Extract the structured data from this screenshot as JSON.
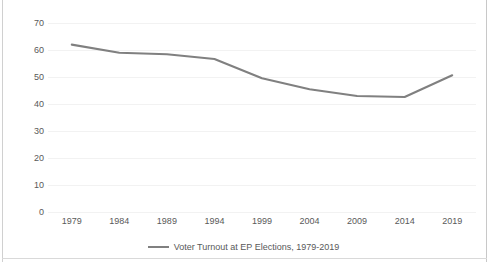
{
  "chart_data": {
    "type": "line",
    "title": "",
    "xlabel": "",
    "ylabel": "",
    "categories": [
      "1979",
      "1984",
      "1989",
      "1994",
      "1999",
      "2004",
      "2009",
      "2014",
      "2019"
    ],
    "series": [
      {
        "name": "Voter Turnout at EP Elections, 1979-2019",
        "values": [
          61.99,
          58.98,
          58.41,
          56.67,
          49.51,
          45.47,
          42.97,
          42.61,
          50.66
        ],
        "color": "#808080"
      }
    ],
    "ylim": [
      0,
      70
    ],
    "yticks": [
      0,
      10,
      20,
      30,
      40,
      50,
      60,
      70
    ],
    "ytick_labels": [
      "0",
      "10",
      "20",
      "30",
      "40",
      "50",
      "60",
      "70"
    ],
    "grid": true,
    "grid_color": "#f2f2f2",
    "legend_position": "bottom",
    "axis_text_color": "#595959",
    "background": "#ffffff",
    "border_color": "#d0d0d0"
  },
  "legend": {
    "entries": [
      {
        "label": "Voter Turnout at EP Elections, 1979-2019",
        "swatch": "line-swatch"
      }
    ]
  }
}
